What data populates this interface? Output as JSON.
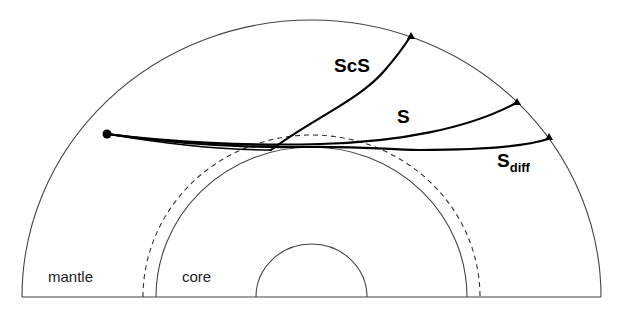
{
  "diagram": {
    "type": "earth-cross-section-ray-paths",
    "regions": [
      {
        "id": "mantle",
        "label": "mantle"
      },
      {
        "id": "core",
        "label": "core"
      }
    ],
    "boundaries": [
      {
        "id": "surface",
        "style": "solid"
      },
      {
        "id": "d-double-prime-top",
        "style": "dashed"
      },
      {
        "id": "core-mantle-boundary",
        "style": "solid"
      },
      {
        "id": "inner-core-boundary",
        "style": "solid"
      }
    ],
    "source": {
      "label": "",
      "marker": "filled-circle"
    },
    "phases": [
      {
        "id": "ScS",
        "label": "ScS",
        "subscript": "",
        "receiver_marker": "triangle"
      },
      {
        "id": "S",
        "label": "S",
        "subscript": "",
        "receiver_marker": "triangle"
      },
      {
        "id": "Sdiff",
        "label": "S",
        "subscript": "diff",
        "receiver_marker": "triangle"
      }
    ],
    "colors": {
      "rays": "#000000",
      "boundaries": "#444444",
      "background": "#ffffff"
    }
  }
}
